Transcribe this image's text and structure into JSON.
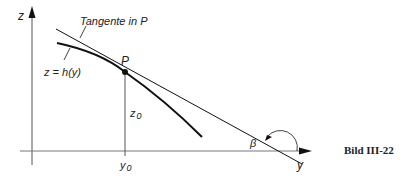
{
  "figure": {
    "caption": "Bild III-22",
    "axes": {
      "vertical_label": "z",
      "horizontal_label": "y"
    },
    "labels": {
      "tangent": "Tangente in P",
      "curve": "z = h(y)",
      "point": "P",
      "z0": "z",
      "z0_sub": "0",
      "y0": "y",
      "y0_sub": "0",
      "angle": "β"
    },
    "colors": {
      "line": "#111111",
      "axis": "#555555"
    }
  }
}
